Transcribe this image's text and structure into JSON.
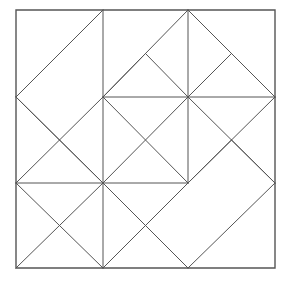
{
  "figure": {
    "canvas": {
      "width": 288,
      "height": 281,
      "background": "#ffffff"
    },
    "stroke": {
      "color": "#555555",
      "width": 1
    },
    "border": {
      "color": "#555555",
      "width": 1.4
    }
  },
  "geometry": {
    "bounds": {
      "x0": 16,
      "y0": 10,
      "x1": 275,
      "y1": 268
    },
    "grid": {
      "columns": 3,
      "rows": 3,
      "x_stops": [
        16,
        103,
        188,
        275
      ],
      "y_stops": [
        10,
        97,
        183,
        268
      ],
      "half_x": [
        59.5,
        145.5,
        231.5
      ],
      "half_y": [
        53.5,
        140,
        225.5
      ]
    },
    "outer_square": [
      [
        16,
        10
      ],
      [
        275,
        10
      ],
      [
        275,
        268
      ],
      [
        16,
        268
      ]
    ],
    "straight_lines": [
      {
        "name": "vertical-grid-left",
        "x1": 103,
        "y1": 10,
        "x2": 103,
        "y2": 268
      },
      {
        "name": "vertical-grid-right",
        "x1": 188,
        "y1": 10,
        "x2": 188,
        "y2": 183
      },
      {
        "name": "horizontal-grid-upper",
        "x1": 103,
        "y1": 97,
        "x2": 275,
        "y2": 97
      },
      {
        "name": "horizontal-grid-lower",
        "x1": 16,
        "y1": 183,
        "x2": 188,
        "y2": 183
      }
    ],
    "diagonals": [
      {
        "name": "tl-diamond-upper",
        "x1": 16,
        "y1": 97,
        "x2": 103,
        "y2": 10
      },
      {
        "name": "tl-diamond-lower",
        "x1": 16,
        "y1": 97,
        "x2": 103,
        "y2": 183
      },
      {
        "name": "tl-cross-a",
        "x1": 16,
        "y1": 183,
        "x2": 103,
        "y2": 97
      },
      {
        "name": "tr-outer-left",
        "x1": 103,
        "y1": 97,
        "x2": 188,
        "y2": 10
      },
      {
        "name": "tr-outer-right",
        "x1": 188,
        "y1": 10,
        "x2": 275,
        "y2": 97
      },
      {
        "name": "tr-inner-left-up",
        "x1": 145.5,
        "y1": 53.5,
        "x2": 188,
        "y2": 97
      },
      {
        "name": "tr-inner-right-up",
        "x1": 231.5,
        "y1": 53.5,
        "x2": 188,
        "y2": 97
      },
      {
        "name": "tr-small-left-edge",
        "x1": 145.5,
        "y1": 53.5,
        "x2": 103,
        "y2": 97
      },
      {
        "name": "tr-small-right-edge",
        "x1": 231.5,
        "y1": 53.5,
        "x2": 275,
        "y2": 97
      },
      {
        "name": "center-x-down",
        "x1": 103,
        "y1": 97,
        "x2": 188,
        "y2": 183
      },
      {
        "name": "center-x-up",
        "x1": 103,
        "y1": 183,
        "x2": 188,
        "y2": 97
      },
      {
        "name": "mid-left-x-down",
        "x1": 16,
        "y1": 97,
        "x2": 103,
        "y2": 183
      },
      {
        "name": "right-upper-diag-down",
        "x1": 188,
        "y1": 97,
        "x2": 275,
        "y2": 183
      },
      {
        "name": "right-upper-diag-up",
        "x1": 188,
        "y1": 183,
        "x2": 275,
        "y2": 97
      },
      {
        "name": "bl-x-down",
        "x1": 16,
        "y1": 183,
        "x2": 103,
        "y2": 268
      },
      {
        "name": "bl-x-up",
        "x1": 16,
        "y1": 268,
        "x2": 103,
        "y2": 183
      },
      {
        "name": "bm-x-down",
        "x1": 103,
        "y1": 183,
        "x2": 188,
        "y2": 268
      },
      {
        "name": "bm-x-up",
        "x1": 103,
        "y1": 268,
        "x2": 188,
        "y2": 183
      },
      {
        "name": "tilt-rect-top-left",
        "x1": 188,
        "y1": 183,
        "x2": 231.5,
        "y2": 140
      },
      {
        "name": "tilt-rect-top-right",
        "x1": 231.5,
        "y1": 140,
        "x2": 275,
        "y2": 183
      },
      {
        "name": "tilt-rect-bottom-left",
        "x1": 188,
        "y1": 268,
        "x2": 275,
        "y2": 183
      }
    ]
  }
}
